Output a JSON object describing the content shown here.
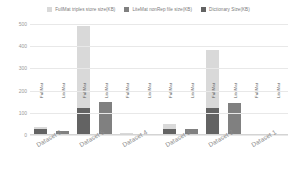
{
  "chart_data": {
    "type": "bar",
    "title": "",
    "xlabel": "",
    "ylabel": "",
    "ylim": [
      0,
      500
    ],
    "yticks": [
      500,
      400,
      300,
      200,
      100,
      0
    ],
    "grid": true,
    "legend_position": "top-center",
    "stacked": true,
    "categories": [
      "Dataset 6",
      "Dataset 5",
      "Dataset 4",
      "Dataset 3",
      "Dataset 2",
      "Dataset 1"
    ],
    "bar_labels": [
      "FullMat",
      "LiteMat"
    ],
    "series": [
      {
        "name": "FullMat triples store size(KB)",
        "color": "#d9d9d9",
        "values": [
          35,
          490,
          10,
          50,
          385,
          6
        ]
      },
      {
        "name": "LiteMat nonRep file size(KB)",
        "color": "#808080",
        "values": [
          20,
          150,
          5,
          28,
          143,
          4
        ]
      },
      {
        "name": "Dictionary Size(KB)",
        "color": "#636363",
        "values": [
          25,
          120,
          6,
          25,
          120,
          4
        ]
      }
    ],
    "groups": [
      {
        "category": "Dataset 6",
        "bars": [
          {
            "label": "FullMat",
            "total": 35,
            "segments": [
              {
                "series": "Dictionary Size(KB)",
                "value": 25
              },
              {
                "series": "FullMat triples store size(KB)",
                "value": 10
              }
            ]
          },
          {
            "label": "LiteMat",
            "total": 20,
            "segments": [
              {
                "series": "LiteMat nonRep file size(KB)",
                "value": 20
              }
            ]
          }
        ]
      },
      {
        "category": "Dataset 5",
        "bars": [
          {
            "label": "FullMat",
            "total": 490,
            "segments": [
              {
                "series": "Dictionary Size(KB)",
                "value": 120
              },
              {
                "series": "FullMat triples store size(KB)",
                "value": 370
              }
            ]
          },
          {
            "label": "LiteMat",
            "total": 150,
            "segments": [
              {
                "series": "LiteMat nonRep file size(KB)",
                "value": 150
              }
            ]
          }
        ]
      },
      {
        "category": "Dataset 4",
        "bars": [
          {
            "label": "FullMat",
            "total": 10,
            "segments": [
              {
                "series": "Dictionary Size(KB)",
                "value": 6
              },
              {
                "series": "FullMat triples store size(KB)",
                "value": 4
              }
            ]
          },
          {
            "label": "LiteMat",
            "total": 5,
            "segments": [
              {
                "series": "LiteMat nonRep file size(KB)",
                "value": 5
              }
            ]
          }
        ]
      },
      {
        "category": "Dataset 3",
        "bars": [
          {
            "label": "FullMat",
            "total": 50,
            "segments": [
              {
                "series": "Dictionary Size(KB)",
                "value": 25
              },
              {
                "series": "FullMat triples store size(KB)",
                "value": 25
              }
            ]
          },
          {
            "label": "LiteMat",
            "total": 28,
            "segments": [
              {
                "series": "LiteMat nonRep file size(KB)",
                "value": 28
              }
            ]
          }
        ]
      },
      {
        "category": "Dataset 2",
        "bars": [
          {
            "label": "FullMat",
            "total": 385,
            "segments": [
              {
                "series": "Dictionary Size(KB)",
                "value": 120
              },
              {
                "series": "FullMat triples store size(KB)",
                "value": 265
              }
            ]
          },
          {
            "label": "LiteMat",
            "total": 143,
            "segments": [
              {
                "series": "LiteMat nonRep file size(KB)",
                "value": 143
              }
            ]
          }
        ]
      },
      {
        "category": "Dataset 1",
        "bars": [
          {
            "label": "FullMat",
            "total": 6,
            "segments": [
              {
                "series": "Dictionary Size(KB)",
                "value": 4
              },
              {
                "series": "FullMat triples store size(KB)",
                "value": 2
              }
            ]
          },
          {
            "label": "LiteMat",
            "total": 4,
            "segments": [
              {
                "series": "LiteMat nonRep file size(KB)",
                "value": 4
              }
            ]
          }
        ]
      }
    ]
  },
  "legend": {
    "items": [
      {
        "label": "FullMat triples store size(KB)",
        "color": "#d9d9d9"
      },
      {
        "label": "LiteMat nonRep file size(KB)",
        "color": "#808080"
      },
      {
        "label": "Dictionary Size(KB)",
        "color": "#636363"
      }
    ]
  },
  "colors": {
    "background": "#ffffff",
    "grid": "#e8e8e8",
    "axis_text": "#9a9a9a",
    "category_text": "#8c8c8c",
    "bar_text": "#5a5a5a",
    "legend_text": "#7b7b7b"
  }
}
